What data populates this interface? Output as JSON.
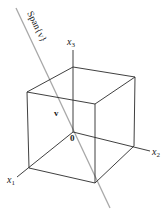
{
  "diagram": {
    "colors": {
      "edge": "#2a2a2a",
      "span_line": "#a8a8a8",
      "background": "#ffffff"
    },
    "labels": {
      "span": "Span{v}",
      "vector": "v",
      "origin": "0",
      "x1": "x",
      "x1_sub": "1",
      "x2": "x",
      "x2_sub": "2",
      "x3": "x",
      "x3_sub": "3"
    }
  }
}
